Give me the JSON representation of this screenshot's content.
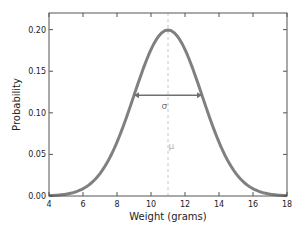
{
  "chart_data": {
    "type": "line",
    "title": "",
    "xlabel": "Weight (grams)",
    "ylabel": "Probability",
    "xlim": [
      4,
      18
    ],
    "ylim": [
      0,
      0.22
    ],
    "xticks": [
      4,
      6,
      8,
      10,
      12,
      14,
      16,
      18
    ],
    "xtick_labels": [
      "4",
      "6",
      "8",
      "10",
      "12",
      "14",
      "16",
      "18"
    ],
    "yticks": [
      0.0,
      0.05,
      0.1,
      0.15,
      0.2
    ],
    "ytick_labels": [
      "0.00",
      "0.05",
      "0.10",
      "0.15",
      "0.20"
    ],
    "grid": false,
    "legend": null,
    "series": [
      {
        "name": "Normal distribution (mean 11, sd 2)",
        "distribution": "normal",
        "mean": 11,
        "std": 2,
        "peak": 0.1995,
        "x": [
          4,
          5,
          6,
          7,
          8,
          9,
          10,
          11,
          12,
          13,
          14,
          15,
          16,
          17,
          18
        ],
        "y": [
          0.0004,
          0.0022,
          0.0088,
          0.027,
          0.0648,
          0.121,
          0.176,
          0.1995,
          0.176,
          0.121,
          0.0648,
          0.027,
          0.0088,
          0.0022,
          0.0004
        ],
        "color": "#808080"
      }
    ],
    "annotations": [
      {
        "type": "vline",
        "x": 11,
        "style": "dashed",
        "color": "#c8c8c8"
      },
      {
        "type": "double-arrow",
        "x_from": 9,
        "x_to": 13,
        "y": 0.121,
        "color": "#707070",
        "label": "σ",
        "label_x": 10.2,
        "label_y": 0.11
      },
      {
        "type": "text",
        "text": "μ",
        "x": 11.2,
        "y": 0.06,
        "color": "#b4b4b4"
      }
    ]
  },
  "annotations_text": {
    "sigma": "σ",
    "mu": "μ"
  },
  "colors": {
    "curve": "#808080",
    "frame": "#555555",
    "mean_line": "#c8c8c8",
    "sigma_arrow": "#707070",
    "mu_label": "#b0b0b0"
  }
}
